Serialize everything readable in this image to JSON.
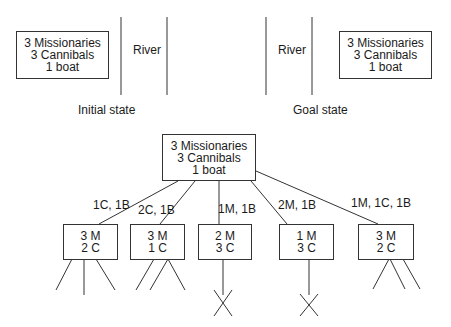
{
  "initial": {
    "box": [
      "3 Missionaries",
      "3 Cannibals",
      "1 boat"
    ],
    "river_label": "River",
    "caption": "Initial state"
  },
  "goal": {
    "box": [
      "3 Missionaries",
      "3 Cannibals",
      "1 boat"
    ],
    "river_label": "River",
    "caption": "Goal state"
  },
  "tree": {
    "root": [
      "3 Missionaries",
      "3 Cannibals",
      "1 boat"
    ],
    "edges": [
      "1C, 1B",
      "2C, 1B",
      "1M, 1B",
      "2M, 1B",
      "1M, 1C, 1B"
    ],
    "children": [
      {
        "lines": [
          "3 M",
          "2 C"
        ],
        "dead": false
      },
      {
        "lines": [
          "3 M",
          "1 C"
        ],
        "dead": false
      },
      {
        "lines": [
          "2 M",
          "3 C"
        ],
        "dead": true
      },
      {
        "lines": [
          "1 M",
          "3 C"
        ],
        "dead": true
      },
      {
        "lines": [
          "3 M",
          "2 C"
        ],
        "dead": false
      }
    ]
  },
  "colors": {
    "stroke": "#333333",
    "text": "#1a1a1a"
  }
}
